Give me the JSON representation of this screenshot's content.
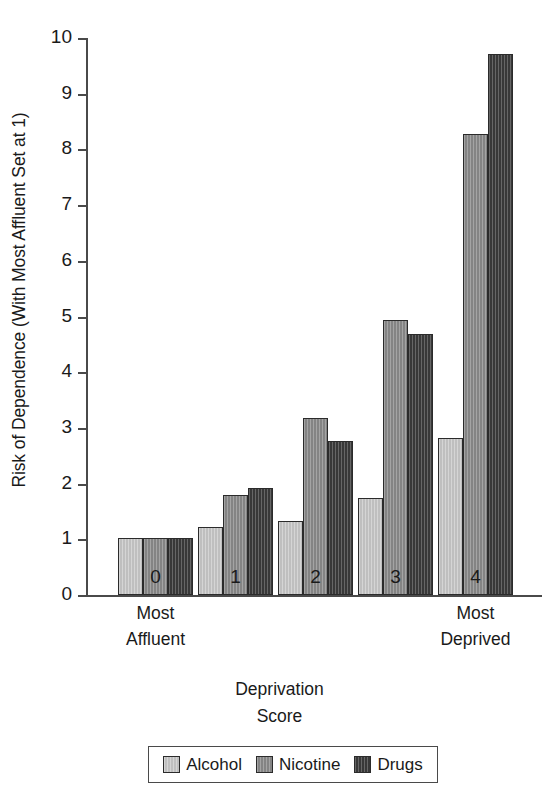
{
  "chart_data": {
    "type": "bar",
    "title": "",
    "subtitle": "",
    "xlabel": "Deprivation Score",
    "ylabel": "Risk of Dependence (With Most Affluent Set at 1)",
    "categories": [
      "0",
      "1",
      "2",
      "3",
      "4"
    ],
    "category_end_labels": {
      "left": "Most Affluent",
      "right": "Most Deprived"
    },
    "series": [
      {
        "name": "Alcohol",
        "color": "#c9c9c9",
        "values": [
          1.02,
          1.22,
          1.32,
          1.74,
          2.81
        ]
      },
      {
        "name": "Nicotine",
        "color": "#8b8b8b",
        "values": [
          1.02,
          1.8,
          3.18,
          4.94,
          8.28
        ]
      },
      {
        "name": "Drugs",
        "color": "#3b3b3b",
        "values": [
          1.02,
          1.93,
          2.77,
          4.69,
          9.72
        ]
      }
    ],
    "ylim": [
      0,
      10
    ],
    "yticks": [
      0,
      1,
      2,
      3,
      4,
      5,
      6,
      7,
      8,
      9,
      10
    ],
    "ytick_labels": [
      "0",
      "1",
      "2",
      "3",
      "4",
      "5",
      "6",
      "7",
      "8",
      "9",
      "10"
    ],
    "grid": false,
    "legend_position": "bottom-center",
    "legend_border_color": "#4a4a4a",
    "axis_color": "#4a4a4a"
  },
  "axes": {
    "y_title": "Risk of Dependence (With Most Affluent Set at 1)",
    "x_title_line1": "Deprivation",
    "x_title_line2": "Score"
  },
  "end_labels": {
    "left_line1": "Most",
    "left_line2": "Affluent",
    "right_line1": "Most",
    "right_line2": "Deprived"
  },
  "legend": {
    "items": [
      {
        "label": "Alcohol",
        "swatch": "alcohol-swatch"
      },
      {
        "label": "Nicotine",
        "swatch": "nicotine-swatch"
      },
      {
        "label": "Drugs",
        "swatch": "drugs-swatch"
      }
    ]
  }
}
